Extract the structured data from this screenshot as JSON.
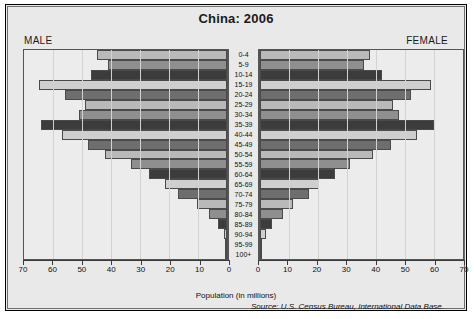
{
  "chart_data": {
    "type": "bar",
    "subtype": "population-pyramid",
    "title": "China: 2006",
    "xlabel": "Population (in millions)",
    "ylabel": "",
    "source": "Source: U.S. Census Bureau, International Data Base.",
    "left_label": "MALE",
    "right_label": "FEMALE",
    "xlim": [
      0,
      70
    ],
    "xticks": [
      0,
      10,
      20,
      30,
      40,
      50,
      60,
      70
    ],
    "left_tick_labels": [
      "70",
      "60",
      "50",
      "40",
      "30",
      "20",
      "10",
      "0"
    ],
    "right_tick_labels": [
      "0",
      "10",
      "20",
      "30",
      "40",
      "50",
      "60",
      "70"
    ],
    "grid": true,
    "legend": "none",
    "categories": [
      "100+",
      "95-99",
      "90-94",
      "85-89",
      "80-84",
      "75-79",
      "70-74",
      "65-69",
      "60-64",
      "55-59",
      "50-54",
      "45-49",
      "40-44",
      "35-39",
      "30-34",
      "25-29",
      "20-24",
      "15-19",
      "10-14",
      "5-9",
      "0-4"
    ],
    "series": [
      {
        "name": "MALE",
        "side": "left",
        "values": [
          0.1,
          0.4,
          1.2,
          3.0,
          6.3,
          10.5,
          17.0,
          21.5,
          27.0,
          33.0,
          42.0,
          48.0,
          57.0,
          64.0,
          51.0,
          49.0,
          56.0,
          65.0,
          47.0,
          41.0,
          45.0
        ]
      },
      {
        "name": "FEMALE",
        "side": "right",
        "values": [
          0.2,
          0.7,
          1.9,
          4.2,
          7.8,
          11.5,
          17.0,
          20.5,
          26.0,
          31.0,
          39.0,
          45.0,
          54.0,
          60.0,
          48.0,
          46.0,
          52.0,
          59.0,
          42.0,
          36.0,
          38.0
        ]
      }
    ],
    "bar_colors_cycle": [
      "#b9b9b9",
      "#6e6e6e",
      "#cfcfcf",
      "#3c3c3c",
      "#8f8f8f"
    ],
    "colors": {
      "panel_background": "#ececec",
      "page_background": "#e9e9e9",
      "frame_border": "#000000",
      "axis": "#3a3a3a",
      "gridline": "#d2d2d2",
      "text": "#111111"
    }
  }
}
